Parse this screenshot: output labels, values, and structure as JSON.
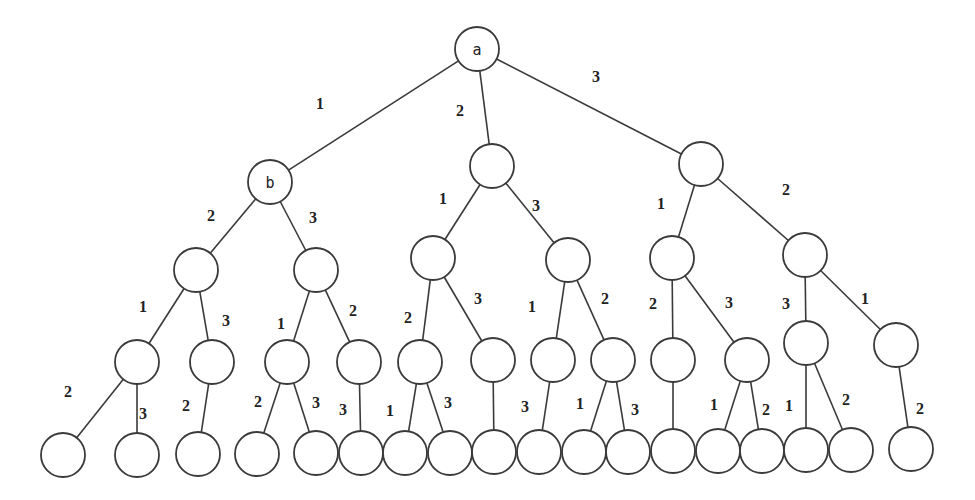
{
  "diagram": {
    "type": "tree",
    "node_radius": 22,
    "colors": {
      "stroke": "#3a3a3a",
      "fill": "#ffffff",
      "text": "#222222",
      "background": "#ffffff"
    },
    "nodes": [
      {
        "id": "a",
        "x": 477,
        "y": 49,
        "label": "a"
      },
      {
        "id": "b",
        "x": 270,
        "y": 182,
        "label": "b"
      },
      {
        "id": "n1m",
        "x": 492,
        "y": 166,
        "label": ""
      },
      {
        "id": "n1r",
        "x": 701,
        "y": 164,
        "label": ""
      },
      {
        "id": "n2a",
        "x": 196,
        "y": 270,
        "label": ""
      },
      {
        "id": "n2b",
        "x": 316,
        "y": 270,
        "label": ""
      },
      {
        "id": "n2c",
        "x": 433,
        "y": 258,
        "label": ""
      },
      {
        "id": "n2d",
        "x": 568,
        "y": 260,
        "label": ""
      },
      {
        "id": "n2e",
        "x": 672,
        "y": 258,
        "label": ""
      },
      {
        "id": "n2f",
        "x": 805,
        "y": 255,
        "label": ""
      },
      {
        "id": "n3a",
        "x": 137,
        "y": 362,
        "label": ""
      },
      {
        "id": "n3b",
        "x": 212,
        "y": 362,
        "label": ""
      },
      {
        "id": "n3c",
        "x": 287,
        "y": 362,
        "label": ""
      },
      {
        "id": "n3d",
        "x": 359,
        "y": 362,
        "label": ""
      },
      {
        "id": "n3e",
        "x": 420,
        "y": 362,
        "label": ""
      },
      {
        "id": "n3f",
        "x": 493,
        "y": 360,
        "label": ""
      },
      {
        "id": "n3g",
        "x": 553,
        "y": 360,
        "label": ""
      },
      {
        "id": "n3h",
        "x": 613,
        "y": 360,
        "label": ""
      },
      {
        "id": "n3i",
        "x": 673,
        "y": 360,
        "label": ""
      },
      {
        "id": "n3j",
        "x": 747,
        "y": 360,
        "label": ""
      },
      {
        "id": "n3k",
        "x": 806,
        "y": 343,
        "label": ""
      },
      {
        "id": "n3l",
        "x": 896,
        "y": 345,
        "label": ""
      },
      {
        "id": "l1",
        "x": 63,
        "y": 455,
        "label": ""
      },
      {
        "id": "l2",
        "x": 137,
        "y": 455,
        "label": ""
      },
      {
        "id": "l3",
        "x": 198,
        "y": 454,
        "label": ""
      },
      {
        "id": "l4",
        "x": 257,
        "y": 454,
        "label": ""
      },
      {
        "id": "l5",
        "x": 316,
        "y": 453,
        "label": ""
      },
      {
        "id": "l6",
        "x": 361,
        "y": 453,
        "label": ""
      },
      {
        "id": "l7",
        "x": 405,
        "y": 453,
        "label": ""
      },
      {
        "id": "l8",
        "x": 450,
        "y": 453,
        "label": ""
      },
      {
        "id": "l9",
        "x": 494,
        "y": 452,
        "label": ""
      },
      {
        "id": "l10",
        "x": 539,
        "y": 452,
        "label": ""
      },
      {
        "id": "l11",
        "x": 584,
        "y": 452,
        "label": ""
      },
      {
        "id": "l12",
        "x": 628,
        "y": 452,
        "label": ""
      },
      {
        "id": "l13",
        "x": 673,
        "y": 451,
        "label": ""
      },
      {
        "id": "l14",
        "x": 718,
        "y": 451,
        "label": ""
      },
      {
        "id": "l15",
        "x": 762,
        "y": 451,
        "label": ""
      },
      {
        "id": "l16",
        "x": 806,
        "y": 450,
        "label": ""
      },
      {
        "id": "l17",
        "x": 851,
        "y": 450,
        "label": ""
      },
      {
        "id": "l18",
        "x": 911,
        "y": 449,
        "label": ""
      }
    ],
    "edges": [
      {
        "from": "a",
        "to": "b",
        "label": "1",
        "lx": 320,
        "ly": 103
      },
      {
        "from": "a",
        "to": "n1m",
        "label": "2",
        "lx": 460,
        "ly": 110
      },
      {
        "from": "a",
        "to": "n1r",
        "label": "3",
        "lx": 596,
        "ly": 76
      },
      {
        "from": "b",
        "to": "n2a",
        "label": "2",
        "lx": 211,
        "ly": 215
      },
      {
        "from": "b",
        "to": "n2b",
        "label": "3",
        "lx": 313,
        "ly": 217
      },
      {
        "from": "n1m",
        "to": "n2c",
        "label": "1",
        "lx": 443,
        "ly": 198
      },
      {
        "from": "n1m",
        "to": "n2d",
        "label": "3",
        "lx": 536,
        "ly": 205
      },
      {
        "from": "n1r",
        "to": "n2e",
        "label": "1",
        "lx": 661,
        "ly": 203
      },
      {
        "from": "n1r",
        "to": "n2f",
        "label": "2",
        "lx": 786,
        "ly": 189
      },
      {
        "from": "n2a",
        "to": "n3a",
        "label": "1",
        "lx": 143,
        "ly": 306
      },
      {
        "from": "n2a",
        "to": "n3b",
        "label": "3",
        "lx": 226,
        "ly": 320
      },
      {
        "from": "n2b",
        "to": "n3c",
        "label": "1",
        "lx": 281,
        "ly": 323
      },
      {
        "from": "n2b",
        "to": "n3d",
        "label": "2",
        "lx": 353,
        "ly": 310
      },
      {
        "from": "n2c",
        "to": "n3e",
        "label": "2",
        "lx": 408,
        "ly": 317
      },
      {
        "from": "n2c",
        "to": "n3f",
        "label": "3",
        "lx": 478,
        "ly": 298
      },
      {
        "from": "n2d",
        "to": "n3g",
        "label": "1",
        "lx": 532,
        "ly": 306
      },
      {
        "from": "n2d",
        "to": "n3h",
        "label": "2",
        "lx": 605,
        "ly": 298
      },
      {
        "from": "n2e",
        "to": "n3i",
        "label": "2",
        "lx": 653,
        "ly": 303
      },
      {
        "from": "n2e",
        "to": "n3j",
        "label": "3",
        "lx": 729,
        "ly": 302
      },
      {
        "from": "n2f",
        "to": "n3k",
        "label": "3",
        "lx": 786,
        "ly": 303
      },
      {
        "from": "n2f",
        "to": "n3l",
        "label": "1",
        "lx": 865,
        "ly": 298
      },
      {
        "from": "n3a",
        "to": "l1",
        "label": "2",
        "lx": 68,
        "ly": 391
      },
      {
        "from": "n3a",
        "to": "l2",
        "label": "3",
        "lx": 143,
        "ly": 413
      },
      {
        "from": "n3b",
        "to": "l3",
        "label": "2",
        "lx": 186,
        "ly": 405
      },
      {
        "from": "n3c",
        "to": "l4",
        "label": "2",
        "lx": 258,
        "ly": 401
      },
      {
        "from": "n3c",
        "to": "l5",
        "label": "3",
        "lx": 316,
        "ly": 402
      },
      {
        "from": "n3d",
        "to": "l6",
        "label": "3",
        "lx": 343,
        "ly": 409
      },
      {
        "from": "n3e",
        "to": "l7",
        "label": "1",
        "lx": 390,
        "ly": 410
      },
      {
        "from": "n3e",
        "to": "l8",
        "label": "3",
        "lx": 448,
        "ly": 402
      },
      {
        "from": "n3f",
        "to": "l9",
        "label": "",
        "lx": 0,
        "ly": 0
      },
      {
        "from": "n3g",
        "to": "l10",
        "label": "3",
        "lx": 525,
        "ly": 406
      },
      {
        "from": "n3h",
        "to": "l11",
        "label": "1",
        "lx": 580,
        "ly": 403
      },
      {
        "from": "n3h",
        "to": "l12",
        "label": "3",
        "lx": 635,
        "ly": 409
      },
      {
        "from": "n3i",
        "to": "l13",
        "label": "",
        "lx": 0,
        "ly": 0
      },
      {
        "from": "n3j",
        "to": "l14",
        "label": "1",
        "lx": 714,
        "ly": 404
      },
      {
        "from": "n3j",
        "to": "l15",
        "label": "2",
        "lx": 766,
        "ly": 409
      },
      {
        "from": "n3k",
        "to": "l16",
        "label": "1",
        "lx": 789,
        "ly": 405
      },
      {
        "from": "n3k",
        "to": "l17",
        "label": "2",
        "lx": 846,
        "ly": 399
      },
      {
        "from": "n3l",
        "to": "l18",
        "label": "2",
        "lx": 920,
        "ly": 408
      }
    ]
  }
}
